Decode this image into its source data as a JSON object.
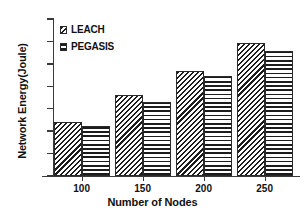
{
  "chart_data": {
    "type": "bar",
    "title": "",
    "xlabel": "Number of Nodes",
    "ylabel": "Network Energy(Joule)",
    "categories": [
      "100",
      "150",
      "200",
      "250"
    ],
    "series": [
      {
        "name": "LEACH",
        "values": [
          24,
          36,
          47,
          59.5
        ]
      },
      {
        "name": "PEGASIS",
        "values": [
          22.3,
          33,
          44.5,
          55.8
        ]
      }
    ],
    "ylim": [
      0,
      70
    ],
    "yticks": [
      "0",
      "10",
      "20",
      "30",
      "40",
      "50",
      "60",
      "70"
    ],
    "ytick_values": [
      0,
      10,
      20,
      30,
      40,
      50,
      60,
      70
    ],
    "grid": false,
    "legend_position": "top-left",
    "legend": [
      {
        "label": "LEACH",
        "pattern": "diagonal-hatch"
      },
      {
        "label": "PEGASIS",
        "pattern": "cross-hatch"
      }
    ],
    "colors": {
      "axis": "#3a3a3a",
      "text": "#111111",
      "pattern_fg": "#1c1c1c",
      "pattern_bg": "#ffffff",
      "background": "#ffffff"
    }
  }
}
